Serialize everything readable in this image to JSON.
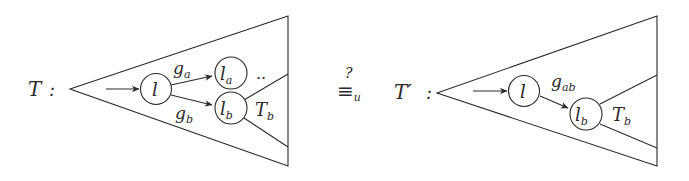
{
  "left_tree": {
    "name": "T",
    "suffix": ":",
    "root_node": "l",
    "edges": [
      {
        "label": "g",
        "sub": "a",
        "target": {
          "main": "l",
          "sub": "a"
        }
      },
      {
        "label": "g",
        "sub": "b",
        "target": {
          "main": "l",
          "sub": "b"
        }
      }
    ],
    "ellipsis": "..",
    "subtree": {
      "main": "T",
      "sub": "b"
    }
  },
  "relation": {
    "symbol": "≡",
    "sub": "u",
    "question": "?"
  },
  "right_tree": {
    "name": "T′",
    "suffix": ":",
    "root_node": "l",
    "edge": {
      "label": "g",
      "sub": "ab"
    },
    "target": {
      "main": "l",
      "sub": "b"
    },
    "subtree": {
      "main": "T",
      "sub": "b"
    }
  },
  "colors": {
    "ink": "#2a2a2a",
    "background": "#ffffff"
  }
}
